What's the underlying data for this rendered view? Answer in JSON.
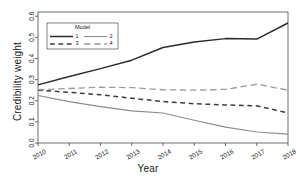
{
  "chart_data": {
    "type": "line",
    "title": "",
    "xlabel": "Year",
    "ylabel": "Credibility weight",
    "x": [
      2010,
      2011,
      2012,
      2013,
      2014,
      2015,
      2016,
      2017,
      2018
    ],
    "xtick_labels": [
      "2010",
      "2011",
      "2012",
      "2013",
      "2014",
      "2015",
      "2016",
      "2017",
      "2018"
    ],
    "ytick_labels": [
      "0.0",
      "0.1",
      "0.2",
      "0.3",
      "0.4",
      "0.5",
      "0.6"
    ],
    "ytick_values": [
      0.0,
      0.1,
      0.2,
      0.3,
      0.4,
      0.5,
      0.6
    ],
    "xlim": [
      2010,
      2018
    ],
    "ylim": [
      0.0,
      0.62
    ],
    "grid": false,
    "legend_title": "Model",
    "legend_position": "top-left-inside",
    "series": [
      {
        "name": "1",
        "label": "1",
        "style": "solid",
        "color": "#2b2b2b",
        "width": 1.5,
        "values": [
          0.275,
          0.315,
          0.352,
          0.392,
          0.452,
          0.478,
          0.494,
          0.492,
          0.568
        ]
      },
      {
        "name": "2",
        "label": "2",
        "style": "solid",
        "color": "#8c8c8c",
        "width": 1.1,
        "values": [
          0.225,
          0.196,
          0.172,
          0.152,
          0.142,
          0.108,
          0.075,
          0.052,
          0.042
        ]
      },
      {
        "name": "3",
        "label": "3",
        "style": "dashed",
        "color": "#3d3d3d",
        "width": 1.5,
        "values": [
          0.25,
          0.24,
          0.228,
          0.212,
          0.196,
          0.186,
          0.18,
          0.176,
          0.142
        ]
      },
      {
        "name": "4",
        "label": "4",
        "style": "longdash",
        "color": "#9a9a9a",
        "width": 1.3,
        "values": [
          0.252,
          0.258,
          0.264,
          0.262,
          0.252,
          0.25,
          0.254,
          0.278,
          0.25
        ]
      }
    ]
  }
}
